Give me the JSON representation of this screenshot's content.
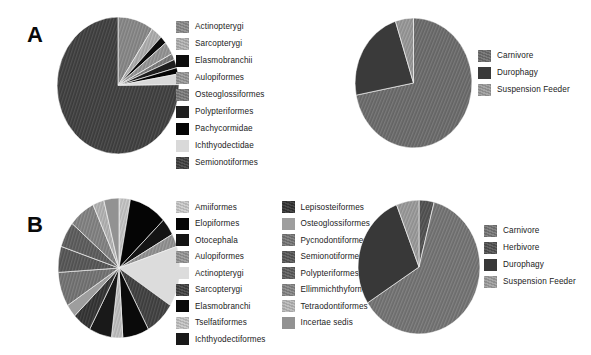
{
  "figure": {
    "background": "#ffffff",
    "panels": [
      "A",
      "B"
    ]
  },
  "panel_a": {
    "label": "A",
    "taxa_legend": [
      {
        "label": "Actinopterygi",
        "color": "#7d7d7d",
        "pattern": "hatch"
      },
      {
        "label": "Sarcopterygi",
        "color": "#a0a0a0",
        "pattern": "hatch"
      },
      {
        "label": "Elasmobranchii",
        "color": "#0d0d0d",
        "pattern": "solid"
      },
      {
        "label": "Aulopiformes",
        "color": "#888888",
        "pattern": "hatch"
      },
      {
        "label": "Osteoglossiformes",
        "color": "#6e6e6e",
        "pattern": "hatch"
      },
      {
        "label": "Polypteriformes",
        "color": "#1f1f1f",
        "pattern": "solid"
      },
      {
        "label": "Pachycormidae",
        "color": "#050505",
        "pattern": "solid"
      },
      {
        "label": "Ichthyodectidae",
        "color": "#d9d9d9",
        "pattern": "solid"
      },
      {
        "label": "Semionotiformes",
        "color": "#3a3a3a",
        "pattern": "hatch"
      }
    ],
    "diet_legend": [
      {
        "label": "Carnivore",
        "color": "#636363",
        "pattern": "hatch"
      },
      {
        "label": "Durophagy",
        "color": "#3a3a3a",
        "pattern": "solid"
      },
      {
        "label": "Suspension Feeder",
        "color": "#8c8c8c",
        "pattern": "hatch"
      }
    ]
  },
  "panel_b": {
    "label": "B",
    "taxa_legend_col1": [
      {
        "label": "Amiiformes",
        "color": "#b5b5b5",
        "pattern": "hatch"
      },
      {
        "label": "Elopiformes",
        "color": "#050505",
        "pattern": "solid"
      },
      {
        "label": "Otocephala",
        "color": "#141414",
        "pattern": "solid"
      },
      {
        "label": "Aulopiformes",
        "color": "#868686",
        "pattern": "hatch"
      },
      {
        "label": "Actinopterygi",
        "color": "#dcdcdc",
        "pattern": "solid"
      },
      {
        "label": "Sarcopterygi",
        "color": "#3b3b3b",
        "pattern": "hatch"
      },
      {
        "label": "Elasmobranchi",
        "color": "#0a0a0a",
        "pattern": "solid"
      },
      {
        "label": "Tselfatiformes",
        "color": "#b0b0b0",
        "pattern": "hatch"
      },
      {
        "label": "Ichthyodectiformes",
        "color": "#191919",
        "pattern": "solid"
      }
    ],
    "taxa_legend_col2": [
      {
        "label": "Lepisosteiformes",
        "color": "#2e2e2e",
        "pattern": "hatch"
      },
      {
        "label": "Osteoglossiformes",
        "color": "#9e9e9e",
        "pattern": "solid"
      },
      {
        "label": "Pycnodontiformes",
        "color": "#6a6a6a",
        "pattern": "hatch"
      },
      {
        "label": "Semionotiformes",
        "color": "#4f4f4f",
        "pattern": "hatch"
      },
      {
        "label": "Polypteriformes",
        "color": "#555555",
        "pattern": "hatch"
      },
      {
        "label": "Ellimmichthyformes",
        "color": "#787878",
        "pattern": "hatch"
      },
      {
        "label": "Tetraodontiformes",
        "color": "#a5a5a5",
        "pattern": "hatch"
      },
      {
        "label": "Incertae sedis",
        "color": "#929292",
        "pattern": "solid"
      }
    ],
    "diet_legend": [
      {
        "label": "Carnivore",
        "color": "#6b6b6b",
        "pattern": "hatch"
      },
      {
        "label": "Herbivore",
        "color": "#4a4a4a",
        "pattern": "hatch"
      },
      {
        "label": "Durophagy",
        "color": "#383838",
        "pattern": "solid"
      },
      {
        "label": "Suspension Feeder",
        "color": "#8e8e8e",
        "pattern": "hatch"
      }
    ]
  },
  "chart_data": [
    {
      "id": "a-taxa",
      "type": "pie",
      "title": "Panel A — taxonomic composition",
      "panel": "A",
      "position": "left",
      "start_angle_deg": 0,
      "direction": "clockwise",
      "legend_position": "right",
      "categories": [
        "Actinopterygi",
        "Sarcopterygi",
        "Elasmobranchii",
        "Aulopiformes",
        "Osteoglossiformes",
        "Polypteriformes",
        "Pachycormidae",
        "Ichthyodectidae",
        "Semionotiformes"
      ],
      "values": [
        9.5,
        3.0,
        1.8,
        3.0,
        1.5,
        2.0,
        1.5,
        2.5,
        75.2
      ],
      "units": "percent",
      "colors": [
        "#7d7d7d",
        "#a0a0a0",
        "#0d0d0d",
        "#888888",
        "#6e6e6e",
        "#1f1f1f",
        "#050505",
        "#d9d9d9",
        "#3a3a3a"
      ]
    },
    {
      "id": "a-diet",
      "type": "pie",
      "title": "Panel A — dietary composition",
      "panel": "A",
      "position": "right",
      "start_angle_deg": 0,
      "direction": "clockwise",
      "legend_position": "right",
      "categories": [
        "Carnivore",
        "Durophagy",
        "Suspension Feeder"
      ],
      "values": [
        72.0,
        23.0,
        5.0
      ],
      "units": "percent",
      "colors": [
        "#636363",
        "#3a3a3a",
        "#8c8c8c"
      ]
    },
    {
      "id": "b-taxa",
      "type": "pie",
      "title": "Panel B — taxonomic composition",
      "panel": "B",
      "position": "left",
      "start_angle_deg": 0,
      "direction": "clockwise",
      "legend_position": "right",
      "categories": [
        "Amiiformes",
        "Elopiformes",
        "Otocephala",
        "Aulopiformes",
        "Actinopterygi",
        "Sarcopterygi",
        "Elasmobranchi",
        "Tselfatiformes",
        "Ichthyodectiformes",
        "Lepisosteiformes",
        "Osteoglossiformes",
        "Pycnodontiformes",
        "Semionotiformes",
        "Polypteriformes",
        "Ellimmichthyformes",
        "Tetraodontiformes",
        "Incertae sedis"
      ],
      "values": [
        3.0,
        10.0,
        4.0,
        3.0,
        14.0,
        8.0,
        7.0,
        3.0,
        6.0,
        5.0,
        3.0,
        8.0,
        6.0,
        6.0,
        7.0,
        3.0,
        4.0
      ],
      "units": "percent",
      "colors": [
        "#b5b5b5",
        "#050505",
        "#141414",
        "#868686",
        "#dcdcdc",
        "#3b3b3b",
        "#0a0a0a",
        "#b0b0b0",
        "#191919",
        "#2e2e2e",
        "#9e9e9e",
        "#6a6a6a",
        "#4f4f4f",
        "#555555",
        "#787878",
        "#a5a5a5",
        "#929292"
      ]
    },
    {
      "id": "b-diet",
      "type": "pie",
      "title": "Panel B — dietary composition",
      "panel": "B",
      "position": "right",
      "start_angle_deg": 0,
      "direction": "clockwise",
      "legend_position": "right",
      "categories": [
        "Herbivore",
        "Carnivore",
        "Durophagy",
        "Suspension Feeder"
      ],
      "values": [
        4.0,
        62.0,
        28.0,
        6.0
      ],
      "units": "percent",
      "colors": [
        "#4a4a4a",
        "#6b6b6b",
        "#383838",
        "#8e8e8e"
      ]
    }
  ]
}
